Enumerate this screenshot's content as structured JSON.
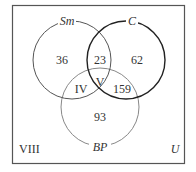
{
  "universe": {
    "label": "U",
    "outside_region_label": "VIII"
  },
  "sets": [
    {
      "id": "sm",
      "label": "Sm",
      "stroke": "#555555"
    },
    {
      "id": "c",
      "label": "C",
      "stroke": "#222222"
    },
    {
      "id": "bp",
      "label": "BP",
      "stroke": "#888888"
    }
  ],
  "regions": {
    "sm_only": "36",
    "sm_c": "23",
    "c_only": "62",
    "sm_bp": "IV",
    "all_three": "V",
    "c_bp": "159",
    "bp_only": "93"
  },
  "colors": {
    "box": "#555555",
    "text": "#333333",
    "background": "#ffffff"
  }
}
